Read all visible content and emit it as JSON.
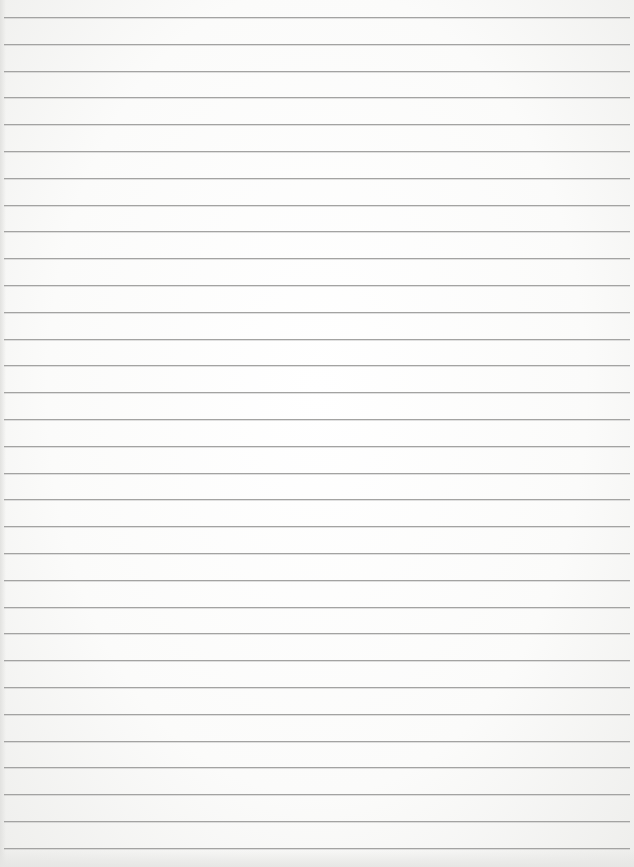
{
  "document": {
    "type": "lined-paper",
    "text": "",
    "rules": {
      "count": 32,
      "first_y": 17,
      "spacing": 26.8,
      "left": 4,
      "right": 630,
      "color": "#a3a3a2"
    },
    "background_color": "#fbfbfa"
  }
}
